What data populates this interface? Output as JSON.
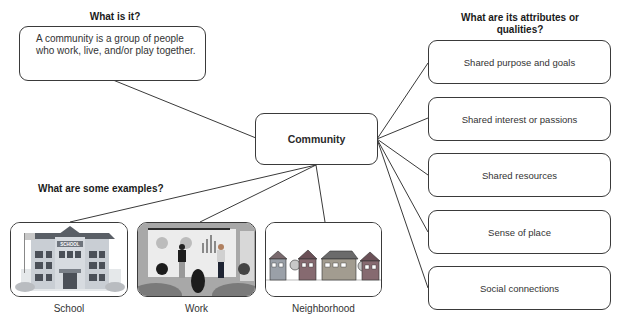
{
  "diagram": {
    "center": {
      "label": "Community"
    },
    "definition": {
      "heading": "What is it?",
      "text": "A community is a group of people who work, live, and/or play together."
    },
    "attributes": {
      "heading": "What are its attributes or qualities?",
      "items": [
        {
          "label": "Shared purpose and goals"
        },
        {
          "label": "Shared interest or passions"
        },
        {
          "label": "Shared resources"
        },
        {
          "label": "Sense of place"
        },
        {
          "label": "Social connections"
        }
      ]
    },
    "examples": {
      "heading": "What are some examples?",
      "items": [
        {
          "label": "School",
          "image": "school-building-illustration",
          "sign_text": "SCHOOL"
        },
        {
          "label": "Work",
          "image": "office-presentation-illustration"
        },
        {
          "label": "Neighborhood",
          "image": "row-of-houses-illustration"
        }
      ]
    },
    "colors": {
      "line": "#3a3a3a",
      "border": "#3a3a3a",
      "text": "#333333",
      "heading": "#1a1a1a"
    }
  }
}
